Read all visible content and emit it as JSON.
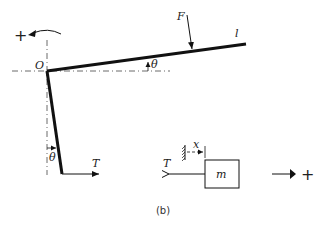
{
  "diagram": {
    "caption": "(b)",
    "labels": {
      "origin": "O",
      "force": "F",
      "length": "l",
      "theta_beam": "θ",
      "theta_pendulum": "θ",
      "tension_right": "T",
      "tension_left": "T",
      "displacement": "x",
      "mass": "m",
      "positive_rotation": "+",
      "positive_translation": "+"
    },
    "colors": {
      "stroke": "#111111",
      "background": "#ffffff"
    }
  }
}
